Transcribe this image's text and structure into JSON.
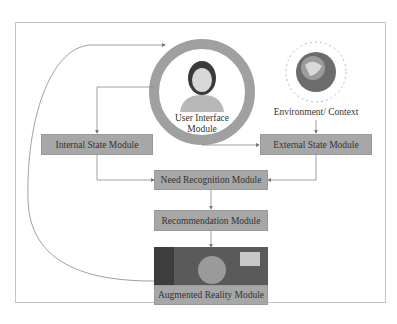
{
  "diagram": {
    "nodes": {
      "user_interface": "User Interface Module",
      "user_interface_line1": "User Interface",
      "user_interface_line2": "Module",
      "environment": "Environment/ Context",
      "internal_state": "Internal State Module",
      "external_state": "External State Module",
      "need_recognition": "Need Recognition Module",
      "recommendation": "Recommendation Module",
      "augmented_reality": "Augmented Reality Module"
    },
    "colors": {
      "box_fill": "#a7a7a7",
      "ring": "#a0a0a0",
      "lines": "#777777",
      "frame": "#bbbbbb"
    }
  }
}
